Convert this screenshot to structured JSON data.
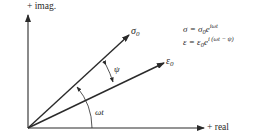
{
  "axes": {
    "imag_label": "+ imag.",
    "real_label": "+ real"
  },
  "vectors": {
    "sigma": {
      "symbol": "σ",
      "subscript": "0"
    },
    "epsilon": {
      "symbol": "ε",
      "subscript": "0"
    }
  },
  "angles": {
    "phase_lag": "ψ",
    "rotation": "ωt"
  },
  "equations": [
    {
      "lhs": "σ = σ",
      "sub": "0",
      "base": "e",
      "exp": "iωt"
    },
    {
      "lhs": "ε = ε",
      "sub": "0",
      "base": "e",
      "exp": "i (ωt − ψ)"
    }
  ],
  "colors": {
    "ink": "#2a2a2a",
    "background": "#ffffff"
  }
}
